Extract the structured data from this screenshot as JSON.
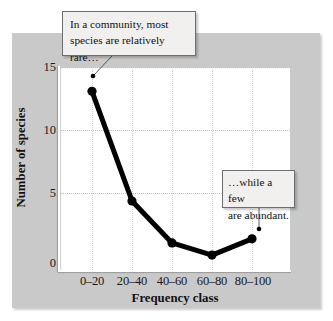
{
  "chart_data": {
    "type": "line",
    "title": "",
    "xlabel": "Frequency class",
    "ylabel": "Number of species",
    "categories": [
      "0–20",
      "20–40",
      "40–60",
      "60–80",
      "80–100"
    ],
    "values": [
      13.2,
      5.1,
      2.0,
      1.1,
      2.3
    ],
    "ylim": [
      0,
      15
    ],
    "yticks": [
      0,
      5,
      10,
      15
    ],
    "grid": true,
    "legend": false,
    "marker": "filled-circle",
    "line_color": "#000000",
    "annotations": [
      {
        "id": "rare",
        "text_line1": "In a community, most",
        "text_line2": "species are relatively rare…",
        "points_to_category": "0–20"
      },
      {
        "id": "abundant",
        "text_line1": "…while a few",
        "text_line2": "are abundant.",
        "points_to_category": "80–100"
      }
    ]
  },
  "figure": {
    "card_color": "#c9c9c9",
    "plot_background": "#ffffff",
    "gridline_color": "#bdbdbd"
  },
  "axes": {
    "y_title": "Number of species",
    "x_title": "Frequency class",
    "y_tick_labels": [
      "15",
      "10",
      "5",
      "0"
    ],
    "x_tick_labels": [
      "0–20",
      "20–40",
      "40–60",
      "60–80",
      "80–100"
    ]
  },
  "callouts": {
    "rare": {
      "line1": "In a community, most",
      "line2": "species are relatively rare…"
    },
    "abundant": {
      "line1": "…while a few",
      "line2": "are abundant."
    }
  }
}
